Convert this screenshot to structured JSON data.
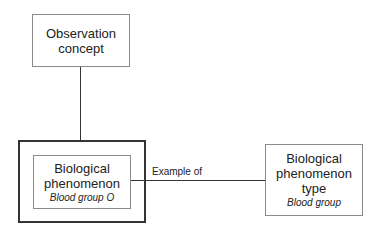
{
  "nodes": {
    "observation": {
      "title_line1": "Observation",
      "title_line2": "concept"
    },
    "phenomenon": {
      "title_line1": "Biological",
      "title_line2": "phenomenon",
      "subtitle": "Blood group O"
    },
    "phenomenon_type": {
      "title_line1": "Biological",
      "title_line2": "phenomenon",
      "title_line3": "type",
      "subtitle": "Blood group"
    }
  },
  "edges": {
    "example_of": {
      "label": "Example of"
    }
  }
}
